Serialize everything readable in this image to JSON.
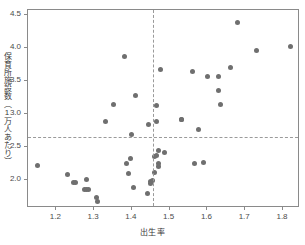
{
  "chart_data": {
    "type": "scatter",
    "title": "",
    "xlabel": "出生率",
    "ylabel": "保育所施設数（1万人あたり）",
    "xlim": [
      1.125,
      1.845
    ],
    "ylim": [
      1.58,
      4.58
    ],
    "xticks": [
      1.2,
      1.3,
      1.4,
      1.5,
      1.6,
      1.7,
      1.8
    ],
    "xtick_labels": [
      "1.2",
      "1.3",
      "1.4",
      "1.5",
      "1.6",
      "1.7",
      "1.8"
    ],
    "yticks": [
      2.0,
      2.5,
      3.0,
      3.5,
      4.0,
      4.5
    ],
    "ytick_labels": [
      "2.0",
      "2.5",
      "3.0",
      "3.5",
      "4.0",
      "4.5"
    ],
    "grid": false,
    "legend": null,
    "marker_color": "#6f6f6f",
    "reference_lines": {
      "vertical_x": 1.455,
      "horizontal_y": 2.655,
      "style": "dashed",
      "color": "#9a9a9a"
    },
    "x": [
      1.15,
      1.23,
      1.245,
      1.25,
      1.275,
      1.28,
      1.28,
      1.285,
      1.305,
      1.31,
      1.33,
      1.35,
      1.38,
      1.385,
      1.39,
      1.395,
      1.4,
      1.405,
      1.41,
      1.44,
      1.445,
      1.45,
      1.45,
      1.455,
      1.46,
      1.46,
      1.465,
      1.465,
      1.465,
      1.47,
      1.47,
      1.47,
      1.475,
      1.485,
      1.53,
      1.53,
      1.56,
      1.565,
      1.575,
      1.59,
      1.6,
      1.63,
      1.63,
      1.635,
      1.66,
      1.68,
      1.73,
      1.82
    ],
    "y": [
      2.22,
      2.09,
      1.97,
      1.96,
      1.86,
      2.01,
      1.855,
      1.865,
      1.745,
      1.675,
      2.885,
      3.155,
      3.875,
      2.255,
      2.11,
      2.33,
      2.69,
      1.885,
      3.285,
      1.805,
      2.845,
      1.975,
      1.955,
      2.0,
      2.125,
      2.355,
      3.135,
      2.89,
      2.375,
      2.215,
      2.26,
      2.445,
      3.68,
      2.425,
      2.92,
      2.925,
      3.645,
      2.25,
      2.775,
      2.27,
      3.57,
      3.355,
      3.575,
      3.15,
      3.71,
      4.385,
      3.965,
      4.025
    ]
  }
}
